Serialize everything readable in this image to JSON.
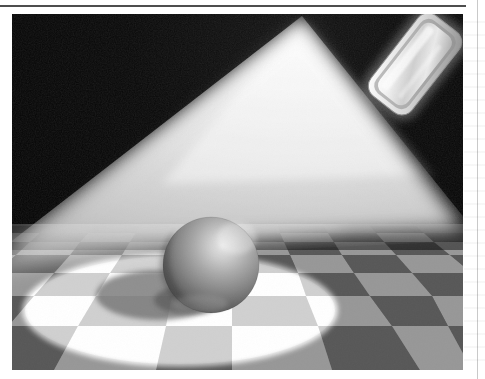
{
  "page": {
    "background_color": "#ffffff",
    "rule_color": "#4e4e4e",
    "margin_rule_color": "#c9c9c9"
  },
  "figure": {
    "name": "volumetric-spotlight-raytrace",
    "caption": "",
    "frame": {
      "x": 12,
      "y": 14,
      "width": 451,
      "height": 356
    },
    "background_color": "#050505",
    "horizon_y": 212,
    "elements": {
      "light_panel": {
        "label": "area-light-panel",
        "center_x": 403,
        "center_y": 50,
        "width": 102,
        "height": 52,
        "rotation_deg": -52,
        "corner_radius": 13,
        "body_color": "#e8e8e8",
        "rim_color": "#f7f7f7",
        "shadow_color": "#6d6d6d"
      },
      "light_cone": {
        "label": "volumetric-beam",
        "apex_x": 290,
        "apex_y": 2,
        "left_base_x": -6,
        "left_base_y": 232,
        "right_base_x": 452,
        "right_base_y": 214,
        "core_color": "#f2f2f2",
        "edge_color": "#050505"
      },
      "floor": {
        "label": "checkerboard-floor",
        "light_tile_color": "#bdbdbd",
        "dark_tile_color": "#6f6f6f",
        "lit_light_tile_color": "#ffffff",
        "lit_dark_tile_color": "#d2d2d2",
        "columns": 10,
        "rows": 9,
        "vanishing_point_x": 330,
        "vanishing_point_y": 212
      },
      "light_pool": {
        "label": "spotlight-pool-ellipse",
        "center_x": 168,
        "center_y": 296,
        "radius_x": 158,
        "radius_y": 57,
        "fill_color": "#ffffff"
      },
      "sphere": {
        "label": "matte-sphere",
        "center_x": 199,
        "center_y": 251,
        "radius": 48,
        "highlight_x": 228,
        "highlight_y": 222,
        "highlight_color": "#e3e3e3",
        "body_color": "#8f8f8f",
        "terminator_color": "#4a4a4a"
      },
      "sphere_shadow": {
        "label": "sphere-cast-shadow",
        "center_x": 146,
        "center_y": 281,
        "radius_x": 62,
        "radius_y": 25,
        "fill_color": "#8d8d8d"
      }
    }
  }
}
